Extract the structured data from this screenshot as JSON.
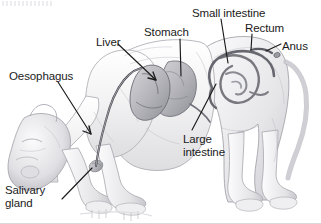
{
  "figure": {
    "kind": "anatomical-diagram",
    "background_color": "#ffffff",
    "ink_color": "#1b1b1b",
    "body_fill": "#f2f2f2",
    "body_shade": "#b9b9bd",
    "organ_shade": "#a8a8ae"
  },
  "labels": [
    {
      "id": "small-intestine",
      "text": "Small intestine",
      "x": 192,
      "y": 7,
      "leader": {
        "x1": 221,
        "y1": 19,
        "x2": 228,
        "y2": 63,
        "arrow": false
      }
    },
    {
      "id": "rectum",
      "text": "Rectum",
      "x": 245,
      "y": 22,
      "leader": {
        "x1": 252,
        "y1": 34,
        "x2": 251,
        "y2": 50,
        "arrow": false
      }
    },
    {
      "id": "anus",
      "text": "Anus",
      "x": 282,
      "y": 40,
      "leader": {
        "x1": 281,
        "y1": 44,
        "x2": 266,
        "y2": 51,
        "arrow": false
      }
    },
    {
      "id": "stomach",
      "text": "Stomach",
      "x": 144,
      "y": 26,
      "leader": {
        "x1": 180,
        "y1": 39,
        "x2": 181,
        "y2": 76,
        "arrow": false
      }
    },
    {
      "id": "liver",
      "text": "Liver",
      "x": 96,
      "y": 36,
      "leader": {
        "x1": 118,
        "y1": 44,
        "x2": 156,
        "y2": 80,
        "arrow": true
      }
    },
    {
      "id": "oesophagus",
      "text": "Oesophagus",
      "x": 9,
      "y": 70,
      "leader": {
        "x1": 58,
        "y1": 82,
        "x2": 91,
        "y2": 134,
        "arrow": true
      }
    },
    {
      "id": "large-intestine",
      "text": "Large\nintestine",
      "x": 183,
      "y": 133,
      "leader": {
        "x1": 192,
        "y1": 130,
        "x2": 216,
        "y2": 84,
        "arrow": false
      }
    },
    {
      "id": "salivary-gland",
      "text": "Salivary\ngland",
      "x": 5,
      "y": 184,
      "leader": {
        "x1": 62,
        "y1": 199,
        "x2": 92,
        "y2": 168,
        "arrow": false
      }
    }
  ],
  "organs": [
    {
      "id": "liver-mass",
      "label": "Liver"
    },
    {
      "id": "stomach-mass",
      "label": "Stomach"
    },
    {
      "id": "oesophagus-tube",
      "label": "Oesophagus"
    },
    {
      "id": "small-intestine-coil",
      "label": "Small intestine"
    },
    {
      "id": "large-intestine-tube",
      "label": "Large intestine"
    },
    {
      "id": "rectum-tube",
      "label": "Rectum"
    },
    {
      "id": "salivary-gland-mass",
      "label": "Salivary gland"
    }
  ]
}
